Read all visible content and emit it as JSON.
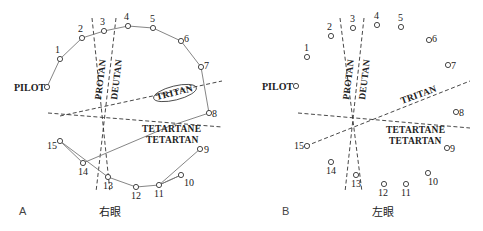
{
  "panels": [
    {
      "id": "A",
      "panel_label": "A",
      "eye_label": "右眼",
      "pilot_label": "PILOT",
      "axis_labels": {
        "protan": "PROTAN",
        "deutan": "DEUTAN",
        "tritan": "TRITAN",
        "tetartane": "TETARTANE",
        "tetartan": "TETARTAN"
      },
      "tritan_highlighted": true,
      "caps": [
        {
          "n": "1",
          "x": 60,
          "y": 59
        },
        {
          "n": "2",
          "x": 82,
          "y": 38
        },
        {
          "n": "3",
          "x": 104,
          "y": 31
        },
        {
          "n": "4",
          "x": 128,
          "y": 26
        },
        {
          "n": "5",
          "x": 153,
          "y": 28
        },
        {
          "n": "6",
          "x": 181,
          "y": 41
        },
        {
          "n": "7",
          "x": 201,
          "y": 67
        },
        {
          "n": "8",
          "x": 209,
          "y": 113
        },
        {
          "n": "9",
          "x": 200,
          "y": 149
        },
        {
          "n": "10",
          "x": 181,
          "y": 175
        },
        {
          "n": "11",
          "x": 159,
          "y": 185
        },
        {
          "n": "12",
          "x": 136,
          "y": 187
        },
        {
          "n": "13",
          "x": 108,
          "y": 177
        },
        {
          "n": "14",
          "x": 83,
          "y": 163
        },
        {
          "n": "15",
          "x": 60,
          "y": 141
        }
      ],
      "arrangement_order": [
        "PILOT",
        "1",
        "2",
        "3",
        "4",
        "5",
        "6",
        "7",
        "8",
        "14",
        "9",
        "11",
        "10",
        "12",
        "13",
        "15"
      ]
    },
    {
      "id": "B",
      "panel_label": "B",
      "eye_label": "左眼",
      "pilot_label": "PILOT",
      "axis_labels": {
        "protan": "PROTAN",
        "deutan": "DEUTAN",
        "tritan": "TRITAN",
        "tetartane": "TETARTANE",
        "tetartan": "TETARTAN"
      },
      "tritan_highlighted": false,
      "caps": [
        {
          "n": "1",
          "x": 307,
          "y": 57
        },
        {
          "n": "2",
          "x": 331,
          "y": 36
        },
        {
          "n": "3",
          "x": 353,
          "y": 28
        },
        {
          "n": "4",
          "x": 377,
          "y": 25
        },
        {
          "n": "5",
          "x": 401,
          "y": 27
        },
        {
          "n": "6",
          "x": 429,
          "y": 40
        },
        {
          "n": "7",
          "x": 448,
          "y": 65
        },
        {
          "n": "8",
          "x": 456,
          "y": 112
        },
        {
          "n": "9",
          "x": 447,
          "y": 148
        },
        {
          "n": "10",
          "x": 428,
          "y": 173
        },
        {
          "n": "11",
          "x": 406,
          "y": 184
        },
        {
          "n": "12",
          "x": 384,
          "y": 184
        },
        {
          "n": "13",
          "x": 356,
          "y": 175
        },
        {
          "n": "14",
          "x": 331,
          "y": 162
        },
        {
          "n": "15",
          "x": 307,
          "y": 146
        }
      ],
      "arrangement_order": []
    }
  ]
}
